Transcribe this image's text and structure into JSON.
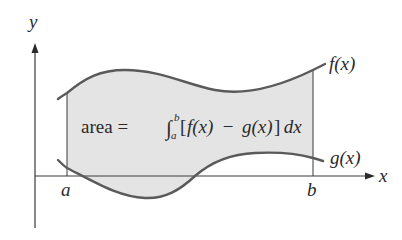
{
  "diagram": {
    "colors": {
      "background": "#ffffff",
      "region_fill": "#e4e4e4",
      "curve_stroke": "#5a5a5a",
      "axis_stroke": "#3a3a3a",
      "text": "#2a2a2a"
    },
    "axes": {
      "x_label": "x",
      "y_label": "y"
    },
    "bounds": {
      "a_label": "a",
      "b_label": "b"
    },
    "curves": {
      "upper_label": "f(x)",
      "lower_label": "g(x)"
    },
    "formula": {
      "prefix": "area = ",
      "integral_sign": "∫",
      "upper_limit": "b",
      "lower_limit": "a",
      "bracket_open": "[",
      "f": "f(x)",
      "minus": " − ",
      "g": "g(x)",
      "bracket_close": "]",
      "dx": " dx"
    }
  }
}
